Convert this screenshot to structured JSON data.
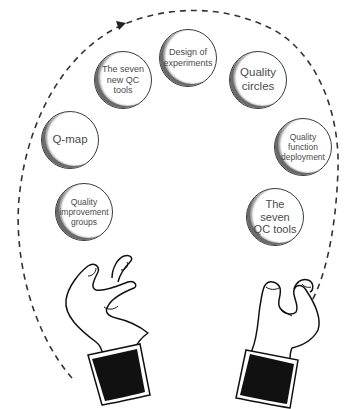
{
  "diagram": {
    "type": "juggling-hands-cycle",
    "colors": {
      "background": "#ffffff",
      "outline": "#1a1a1a",
      "text": "#4a4a4a",
      "cuff": "#111111"
    },
    "balls": [
      {
        "id": "design-of-experiments",
        "label": "Design of experiments",
        "lines": [
          "Design of",
          "experiments"
        ],
        "cx": 188,
        "cy": 58,
        "r": 29,
        "font": 9
      },
      {
        "id": "seven-new-qc-tools",
        "label": "The seven new QC tools",
        "lines": [
          "The seven",
          "new QC",
          "tools"
        ],
        "cx": 123,
        "cy": 80,
        "r": 29,
        "font": 9
      },
      {
        "id": "quality-circles",
        "label": "Quality circles",
        "lines": [
          "Quality",
          "circles"
        ],
        "cx": 258,
        "cy": 80,
        "r": 29,
        "font": 11.5
      },
      {
        "id": "q-map",
        "label": "Q-map",
        "lines": [
          "Q-map"
        ],
        "cx": 70,
        "cy": 140,
        "r": 29,
        "font": 11.5
      },
      {
        "id": "quality-function-deployment",
        "label": "Quality function deployment",
        "lines": [
          "Quality",
          "function",
          "deployment"
        ],
        "cx": 303,
        "cy": 147,
        "r": 29,
        "font": 8.5
      },
      {
        "id": "quality-improvement-groups",
        "label": "Quality improvement groups",
        "lines": [
          "Quality",
          "improvement",
          "groups"
        ],
        "cx": 84,
        "cy": 212,
        "r": 29,
        "font": 8.5
      },
      {
        "id": "seven-qc-tools",
        "label": "The seven QC tools",
        "lines": [
          "The",
          "seven",
          "QC tools"
        ],
        "cx": 275,
        "cy": 217,
        "r": 29,
        "font": 11
      }
    ],
    "path": {
      "style": "dashed",
      "direction": "clockwise",
      "arrowheads": [
        "top-left",
        "bottom-right"
      ]
    },
    "hands": [
      "left-hand",
      "right-hand"
    ]
  }
}
